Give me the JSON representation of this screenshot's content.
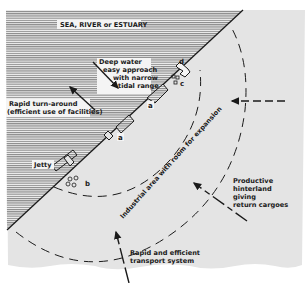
{
  "diagram": {
    "title_region": "SEA, RIVER or ESTUARY",
    "labels": {
      "deep_water": [
        "Deep water",
        "easy approach",
        "with narrow",
        "tidal range"
      ],
      "turnaround": [
        "Rapid turn-around",
        "(efficient use of facilities)"
      ],
      "jetty": "Jetty",
      "industrial": "Industrial area with room for expansion",
      "hinterland": [
        "Productive",
        "hinterland",
        "giving",
        "return cargoes"
      ],
      "transport": [
        "Rapid and efficient",
        "transport system"
      ]
    },
    "markers": {
      "a1": "a",
      "a2": "a",
      "b": "b",
      "c": "c",
      "d": "d"
    },
    "colors": {
      "sea_line": "#6b6b6b",
      "land": "#e4e4e4",
      "ink": "#1a1a1a"
    }
  }
}
